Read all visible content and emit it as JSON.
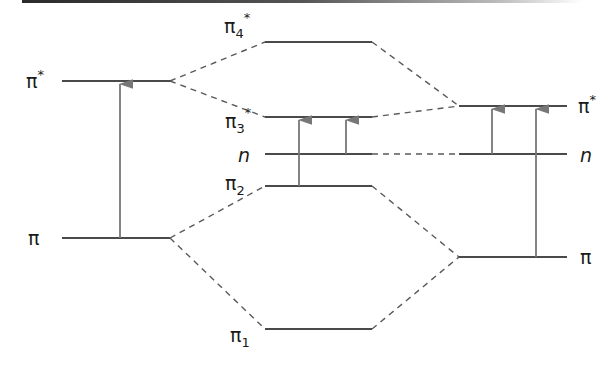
{
  "diagram": {
    "title": "",
    "colors": {
      "level": "#4a4a4a",
      "dashed": "#5a5a5a",
      "arrow": "#777777",
      "text": "#1a1a1a"
    },
    "left_column": {
      "levels": [
        {
          "id": "left-pi-star",
          "label": "π",
          "sup": "*",
          "sub": ""
        },
        {
          "id": "left-pi",
          "label": "π",
          "sup": "",
          "sub": ""
        }
      ]
    },
    "middle_column": {
      "levels": [
        {
          "id": "pi4-star",
          "label": "π",
          "sub": "4",
          "sup": "*"
        },
        {
          "id": "pi3-star",
          "label": "π",
          "sub": "3",
          "sup": "*"
        },
        {
          "id": "n-mid",
          "label": "n",
          "sub": "",
          "sup": ""
        },
        {
          "id": "pi2",
          "label": "π",
          "sub": "2",
          "sup": ""
        },
        {
          "id": "pi1",
          "label": "π",
          "sub": "1",
          "sup": ""
        }
      ]
    },
    "right_column": {
      "levels": [
        {
          "id": "right-pi-star",
          "label": "π",
          "sup": "*",
          "sub": ""
        },
        {
          "id": "right-n",
          "label": "n",
          "sup": "",
          "sub": ""
        },
        {
          "id": "right-pi",
          "label": "π",
          "sup": "",
          "sub": ""
        }
      ]
    },
    "transitions": [
      {
        "from": "left-pi",
        "to": "left-pi-star",
        "type": "π→π*"
      },
      {
        "from": "pi2",
        "to": "pi3-star",
        "type": "π→π*"
      },
      {
        "from": "n-mid",
        "to": "pi3-star",
        "type": "n→π*"
      },
      {
        "from": "right-n",
        "to": "right-pi-star",
        "type": "n→π*"
      },
      {
        "from": "right-pi",
        "to": "right-pi-star",
        "type": "π→π*"
      }
    ]
  }
}
